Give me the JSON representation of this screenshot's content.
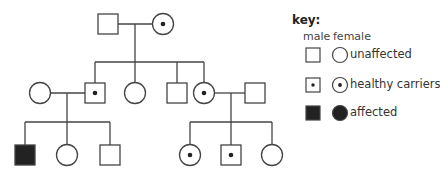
{
  "key": {
    "title": "key:",
    "male_header": "male",
    "female_header": "female",
    "rows": [
      {
        "status": "unaffected",
        "label": "unaffected"
      },
      {
        "status": "carrier",
        "label": "healthy carriers"
      },
      {
        "status": "affected",
        "label": "affected"
      }
    ]
  },
  "colors": {
    "line": "#444444",
    "affected_fill": "#222222",
    "background": "#ffffff"
  },
  "pedigree": {
    "generations": [
      {
        "number": 1,
        "individuals": [
          {
            "id": "I-1",
            "sex": "male",
            "status": "unaffected"
          },
          {
            "id": "I-2",
            "sex": "female",
            "status": "carrier"
          }
        ]
      },
      {
        "number": 2,
        "individuals": [
          {
            "id": "II-1",
            "sex": "female",
            "status": "unaffected",
            "note": "married-in"
          },
          {
            "id": "II-2",
            "sex": "male",
            "status": "carrier"
          },
          {
            "id": "II-3",
            "sex": "female",
            "status": "unaffected"
          },
          {
            "id": "II-4",
            "sex": "male",
            "status": "unaffected"
          },
          {
            "id": "II-5",
            "sex": "female",
            "status": "carrier"
          },
          {
            "id": "II-6",
            "sex": "male",
            "status": "unaffected",
            "note": "married-in"
          }
        ]
      },
      {
        "number": 3,
        "individuals": [
          {
            "id": "III-1",
            "sex": "male",
            "status": "affected"
          },
          {
            "id": "III-2",
            "sex": "female",
            "status": "unaffected"
          },
          {
            "id": "III-3",
            "sex": "male",
            "status": "unaffected"
          },
          {
            "id": "III-4",
            "sex": "female",
            "status": "carrier"
          },
          {
            "id": "III-5",
            "sex": "male",
            "status": "carrier"
          },
          {
            "id": "III-6",
            "sex": "female",
            "status": "unaffected"
          }
        ]
      }
    ]
  }
}
